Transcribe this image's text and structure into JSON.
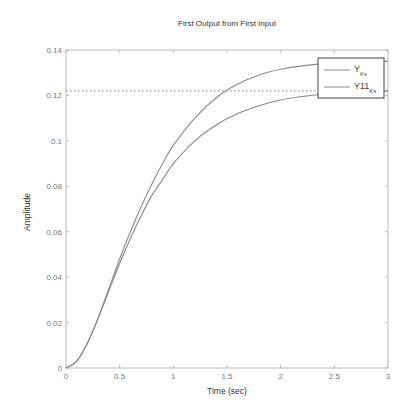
{
  "chart_data": {
    "type": "line",
    "title": "First Output from First Input",
    "xlabel": "Time (sec)",
    "ylabel": "Amplitude",
    "xlim": [
      0,
      3
    ],
    "ylim": [
      0,
      0.14
    ],
    "xticks": [
      0,
      0.5,
      1,
      1.5,
      2,
      2.5,
      3
    ],
    "xtick_labels": [
      "0",
      "0.5",
      "1",
      "1.5",
      "2",
      "2.5",
      "3"
    ],
    "yticks": [
      0,
      0.02,
      0.04,
      0.06,
      0.08,
      0.1,
      0.12,
      0.14
    ],
    "ytick_labels": [
      "0",
      "0.02",
      "0.04",
      "0.06",
      "0.08",
      "0.1",
      "0.12",
      "0.14"
    ],
    "grid": false,
    "legend_position": "upper right",
    "series": [
      {
        "name": "Y",
        "legend_label": "Y",
        "legend_subscript": "Ks",
        "color": "#8a8a8a",
        "x": [
          0,
          0.1,
          0.2,
          0.3,
          0.4,
          0.5,
          0.6,
          0.7,
          0.8,
          0.9,
          1.0,
          1.2,
          1.4,
          1.6,
          1.8,
          2.0,
          2.2,
          2.4,
          2.6,
          2.8,
          3.0
        ],
        "y": [
          0,
          0.003,
          0.011,
          0.022,
          0.035,
          0.048,
          0.06,
          0.071,
          0.081,
          0.09,
          0.098,
          0.11,
          0.119,
          0.125,
          0.129,
          0.1315,
          0.133,
          0.134,
          0.1345,
          0.135,
          0.135
        ]
      },
      {
        "name": "Y11",
        "legend_label": "Y11",
        "legend_subscript": "Ks",
        "color": "#8a8a8a",
        "x": [
          0,
          0.1,
          0.2,
          0.3,
          0.4,
          0.5,
          0.6,
          0.7,
          0.8,
          0.9,
          1.0,
          1.2,
          1.4,
          1.6,
          1.8,
          2.0,
          2.2,
          2.4,
          2.6,
          2.8,
          3.0
        ],
        "y": [
          0,
          0.003,
          0.011,
          0.022,
          0.034,
          0.046,
          0.057,
          0.067,
          0.076,
          0.083,
          0.09,
          0.1,
          0.107,
          0.112,
          0.1155,
          0.118,
          0.1195,
          0.1205,
          0.121,
          0.1215,
          0.122
        ]
      }
    ],
    "annotations": [
      {
        "type": "hline",
        "y": 0.122,
        "style": "dotted",
        "color": "#777777",
        "label": "steady-state"
      }
    ]
  }
}
